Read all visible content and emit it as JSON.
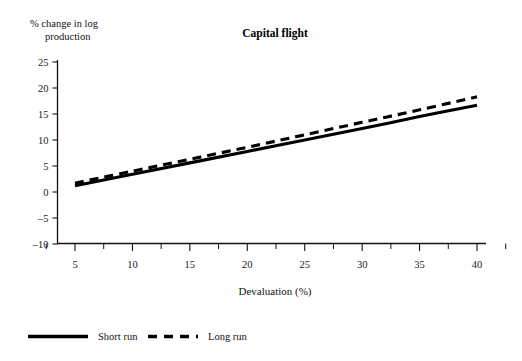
{
  "chart_data": {
    "type": "line",
    "title": "Capital flight",
    "xlabel": "Devaluation (%)",
    "ylabel": "% change in log production",
    "ylabel_line1": "% change in log",
    "ylabel_line2": "production",
    "xlim": [
      2.5,
      42.5
    ],
    "ylim": [
      -10,
      25
    ],
    "xticks": [
      5,
      10,
      15,
      20,
      25,
      30,
      35,
      40
    ],
    "xtick_labels": [
      "5",
      "10",
      "15",
      "20",
      "25",
      "30",
      "35",
      "40"
    ],
    "xticks_minor": [
      2.5,
      7.5,
      12.5,
      17.5,
      22.5,
      27.5,
      32.5,
      37.5,
      42.5
    ],
    "yticks": [
      -10,
      -5,
      0,
      5,
      10,
      15,
      20,
      25
    ],
    "ytick_labels": [
      "-10",
      "-5",
      "0",
      "5",
      "10",
      "15",
      "20",
      "25"
    ],
    "grid": false,
    "legend_position": "below",
    "x": [
      5,
      10,
      15,
      20,
      25,
      30,
      35,
      40
    ],
    "series": [
      {
        "name": "Short run",
        "style": "solid",
        "color": "#000000",
        "values": [
          1.2,
          3.4,
          5.6,
          7.8,
          10.0,
          12.2,
          14.5,
          16.7
        ]
      },
      {
        "name": "Long run",
        "style": "dashed",
        "color": "#000000",
        "values": [
          1.7,
          4.0,
          6.3,
          8.6,
          11.0,
          13.4,
          15.8,
          18.3
        ]
      }
    ]
  },
  "legend": {
    "items": [
      {
        "label": "Short run",
        "style": "solid"
      },
      {
        "label": "Long run",
        "style": "dashed"
      }
    ]
  }
}
